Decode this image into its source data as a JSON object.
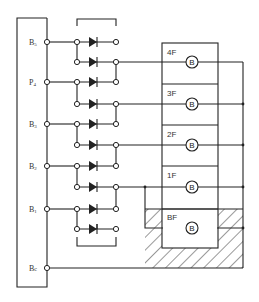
{
  "diagram": {
    "type": "circuit",
    "terminals": [
      {
        "label": "B5",
        "sub": "5",
        "y": 42
      },
      {
        "label": "P4",
        "sub": "4",
        "y": 82
      },
      {
        "label": "B3",
        "sub": "3",
        "y": 124
      },
      {
        "label": "B2",
        "sub": "2",
        "y": 166
      },
      {
        "label": "B1",
        "sub": "1",
        "y": 209
      },
      {
        "label": "Bc",
        "sub": "c",
        "y": 268
      }
    ],
    "terminal_labels": {
      "t5": "B",
      "t5s": "5",
      "t4": "P",
      "t4s": "4",
      "t3": "B",
      "t3s": "3",
      "t2": "B",
      "t2s": "2",
      "t1": "B",
      "t1s": "1",
      "tc": "B",
      "tcs": "c"
    },
    "floors": [
      {
        "label": "4F",
        "bell": "B"
      },
      {
        "label": "3F",
        "bell": "B"
      },
      {
        "label": "2F",
        "bell": "B"
      },
      {
        "label": "1F",
        "bell": "B"
      },
      {
        "label": "BF",
        "bell": "B"
      }
    ],
    "diode_count": 10,
    "component": "bell",
    "hatched_area": "basement"
  }
}
